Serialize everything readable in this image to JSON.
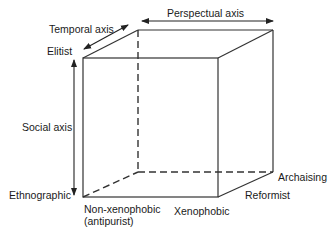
{
  "diagram": {
    "type": "3d-cube-axes",
    "axes": {
      "perspectual": {
        "label": "Perspectual axis",
        "ends": [
          "Non-xenophobic (antipurist)",
          "Xenophobic"
        ]
      },
      "temporal": {
        "label": "Temporal axis",
        "ends": [
          "Archaising",
          "Reformist"
        ]
      },
      "social": {
        "label": "Social axis",
        "ends": [
          "Elitist",
          "Ethnographic"
        ]
      }
    },
    "labels": {
      "temporal_axis": "Temporal axis",
      "perspectual_axis": "Perspectual axis",
      "social_axis": "Social axis",
      "elitist": "Elitist",
      "ethnographic": "Ethnographic",
      "non_xenophobic": "Non-xenophobic",
      "antipurist": "(antipurist)",
      "xenophobic": "Xenophobic",
      "reformist": "Reformist",
      "archaising": "Archaising"
    },
    "colors": {
      "line": "#333333",
      "text": "#1a1a1a",
      "background": "#ffffff"
    }
  }
}
